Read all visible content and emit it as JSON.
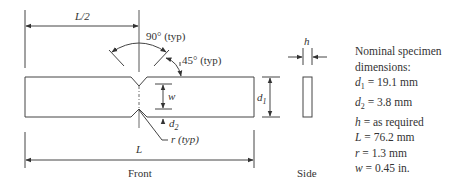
{
  "figure": {
    "type": "notched specimen drawing",
    "views": {
      "front_label": "Front",
      "side_label": "Side"
    },
    "annotations": {
      "half_length": "L/2",
      "length": "L",
      "angle_notch": "90° (typ)",
      "angle_flank": "45° (typ)",
      "width": "w",
      "depth_total": "d",
      "depth_total_sub": "1",
      "notch_depth": "d",
      "notch_depth_sub": "2",
      "radius": "r (typ)",
      "thickness": "h"
    },
    "specs": {
      "title_line1": "Nominal specimen",
      "title_line2": "dimensions:",
      "items": [
        {
          "sym": "d",
          "sub": "1",
          "value": " = 19.1 mm"
        },
        {
          "sym": "d",
          "sub": "2",
          "value": " = 3.8 mm"
        },
        {
          "sym": "h",
          "sub": "",
          "value": " = as required"
        },
        {
          "sym": "L",
          "sub": "",
          "value": " = 76.2 mm"
        },
        {
          "sym": "r",
          "sub": "",
          "value": " = 1.3 mm"
        },
        {
          "sym": "w",
          "sub": "",
          "value": " = 0.45 in."
        }
      ]
    },
    "colors": {
      "line": "#333333",
      "background": "#ffffff"
    }
  }
}
